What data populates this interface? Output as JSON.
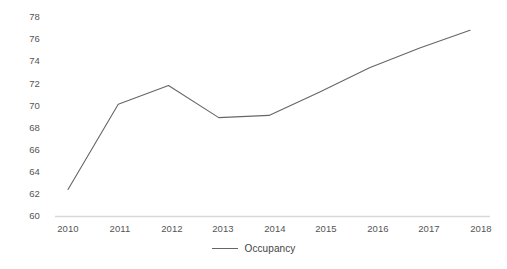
{
  "chart_data": {
    "type": "line",
    "title": "",
    "subtitle": "",
    "xlabel": "",
    "ylabel": "",
    "categories": [
      "2010",
      "2011",
      "2012",
      "2013",
      "2014",
      "2015",
      "2016",
      "2017",
      "2018"
    ],
    "series": [
      {
        "name": "Occupancy",
        "color": "#63666a",
        "values": [
          62.4,
          70.1,
          71.8,
          68.9,
          69.1,
          71.2,
          73.4,
          75.2,
          76.8
        ]
      }
    ],
    "ylim": [
      60,
      78
    ],
    "ytick_step": 2,
    "ytick_labels": [
      "78",
      "76",
      "74",
      "72",
      "70",
      "68",
      "66",
      "64",
      "62",
      "60"
    ],
    "xtick_labels": [
      "2010",
      "2011",
      "2012",
      "2013",
      "2014",
      "2015",
      "2016",
      "2017",
      "2018"
    ],
    "grid": false,
    "axis_color": "#d9d9d9",
    "legend": {
      "position": "bottom-center",
      "entries": [
        {
          "label": "Occupancy",
          "color": "#63666a",
          "marker": "line"
        }
      ]
    },
    "markers": false
  },
  "legend": {
    "occupancy_label": "Occupancy"
  },
  "y_axis": {
    "t0": "78",
    "t1": "76",
    "t2": "74",
    "t3": "72",
    "t4": "70",
    "t5": "68",
    "t6": "66",
    "t7": "64",
    "t8": "62",
    "t9": "60"
  },
  "x_axis": {
    "t0": "2010",
    "t1": "2011",
    "t2": "2012",
    "t3": "2013",
    "t4": "2014",
    "t5": "2015",
    "t6": "2016",
    "t7": "2017",
    "t8": "2018"
  }
}
